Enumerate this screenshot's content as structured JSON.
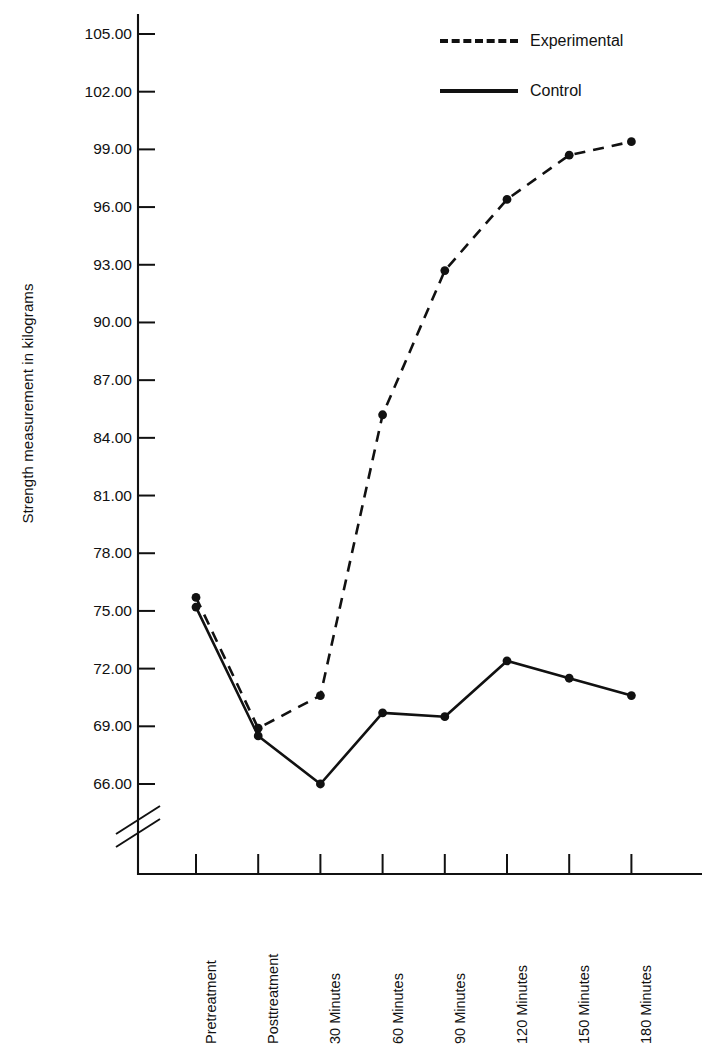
{
  "chart_data": {
    "type": "line",
    "title": "",
    "xlabel": "",
    "ylabel": "Strength measurement in kilograms",
    "categories": [
      "Pretreatment",
      "Posttreatment",
      "30 Minutes",
      "60 Minutes",
      "90 Minutes",
      "120 Minutes",
      "150 Minutes",
      "180 Minutes"
    ],
    "yticks": [
      "66.00",
      "69.00",
      "72.00",
      "75.00",
      "78.00",
      "81.00",
      "84.00",
      "87.00",
      "90.00",
      "93.00",
      "96.00",
      "99.00",
      "102.00",
      "105.00"
    ],
    "ytick_values": [
      66,
      69,
      72,
      75,
      78,
      81,
      84,
      87,
      90,
      93,
      96,
      99,
      102,
      105
    ],
    "ylim": [
      64.5,
      105.8
    ],
    "y_axis_break": true,
    "grid": false,
    "legend_position": "top-right",
    "series": [
      {
        "name": "Experimental",
        "style": "dashed",
        "marker": "circle",
        "values": [
          75.7,
          68.9,
          70.6,
          85.2,
          92.7,
          96.4,
          98.7,
          99.4
        ]
      },
      {
        "name": "Control",
        "style": "solid",
        "marker": "circle",
        "values": [
          75.2,
          68.5,
          66.0,
          69.7,
          69.5,
          72.4,
          71.5,
          70.6
        ]
      }
    ]
  },
  "legend": {
    "items": [
      {
        "label": "Experimental",
        "style": "dashed"
      },
      {
        "label": "Control",
        "style": "solid"
      }
    ]
  }
}
